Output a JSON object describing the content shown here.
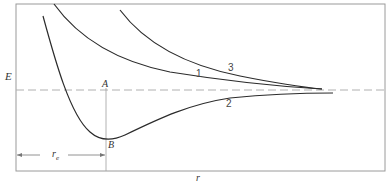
{
  "figure": {
    "type": "potential-energy-diagram",
    "axes": {
      "ylabel": "E",
      "xlabel": "r"
    },
    "points": {
      "A": "A",
      "B": "B"
    },
    "distance_label": "r",
    "distance_subscript": "e",
    "curves": [
      {
        "id": "1",
        "label": "1",
        "description": "repulsive curve (upper, lower of two)"
      },
      {
        "id": "2",
        "label": "2",
        "description": "bound curve with minimum at B"
      },
      {
        "id": "3",
        "label": "3",
        "description": "repulsive curve (uppermost)"
      }
    ],
    "colors": {
      "line": "#2b2b2b",
      "frame": "#9a9a9a",
      "dash": "#b5b5b5"
    }
  }
}
